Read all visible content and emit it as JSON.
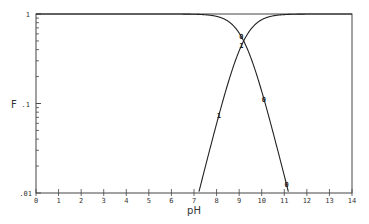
{
  "chart_data": {
    "type": "line",
    "title": "",
    "xlabel": "pH",
    "ylabel": "F",
    "xlim": [
      0,
      14
    ],
    "ylim": [
      0.01,
      1
    ],
    "yscale": "log",
    "x_ticks": [
      "0",
      "1",
      "2",
      "3",
      "4",
      "5",
      "6",
      "7",
      "8",
      "9",
      "10",
      "11",
      "12",
      "13",
      "14"
    ],
    "y_ticks": [
      {
        "value": 1,
        "label": "1"
      },
      {
        "value": 0.1,
        "label": ".1"
      },
      {
        "value": 0.01,
        "label": ".01"
      }
    ],
    "grid": false,
    "legend": "none (curves labeled by inline markers '0' and '1')",
    "series": [
      {
        "name": "F0",
        "marker": "0",
        "x": [
          0,
          7,
          8,
          8.5,
          9,
          9.2,
          9.5,
          10,
          10.5,
          11,
          11.2
        ],
        "y": [
          1,
          0.998,
          0.98,
          0.94,
          0.7,
          0.5,
          0.35,
          0.15,
          0.05,
          0.017,
          0.01
        ]
      },
      {
        "name": "F1",
        "marker": "1",
        "x": [
          7.1,
          7.5,
          8,
          8.5,
          9,
          9.2,
          9.5,
          10,
          10.5,
          11,
          14
        ],
        "y": [
          0.01,
          0.022,
          0.055,
          0.15,
          0.38,
          0.5,
          0.68,
          0.88,
          0.96,
          0.99,
          1
        ]
      }
    ]
  },
  "axes": {
    "xlabel": "pH",
    "ylabel": "F",
    "ytick_top": "1",
    "ytick_mid": ".1",
    "ytick_bottom": ".01"
  },
  "markers": {
    "f0": "0",
    "f1": "1"
  }
}
